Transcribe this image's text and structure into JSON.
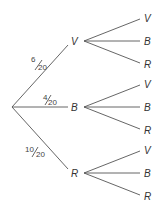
{
  "diagram": {
    "type": "probability-tree",
    "root": {
      "x": 12,
      "y": 107
    },
    "first_level": [
      {
        "label": "V",
        "prob_num": "6",
        "prob_den": "20",
        "x": 74,
        "y": 41
      },
      {
        "label": "B",
        "prob_num": "4",
        "prob_den": "20",
        "x": 74,
        "y": 107
      },
      {
        "label": "R",
        "prob_num": "10",
        "prob_den": "20",
        "x": 74,
        "y": 173
      }
    ],
    "second_level": [
      {
        "parent": "V",
        "children": [
          "V",
          "B",
          "R"
        ]
      },
      {
        "parent": "B",
        "children": [
          "V",
          "B",
          "R"
        ]
      },
      {
        "parent": "R",
        "children": [
          "V",
          "B",
          "R"
        ]
      }
    ]
  }
}
